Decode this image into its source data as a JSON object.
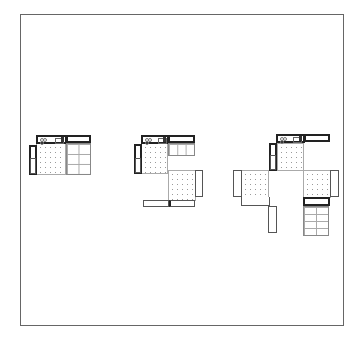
{
  "diagram": {
    "type": "floor-plan-sequence",
    "frame": {
      "x": 20,
      "y": 14,
      "width": 324,
      "height": 312
    },
    "colors": {
      "line": "#555555",
      "thick_line": "#222222",
      "dot_pattern": "#9a9a9a",
      "background": "#ffffff"
    },
    "units": [
      {
        "id": "unit-small",
        "label": "",
        "position": "left",
        "modules": 2
      },
      {
        "id": "unit-medium",
        "label": "",
        "position": "center",
        "modules": 3
      },
      {
        "id": "unit-large",
        "label": "",
        "position": "right",
        "modules": 4
      }
    ]
  }
}
